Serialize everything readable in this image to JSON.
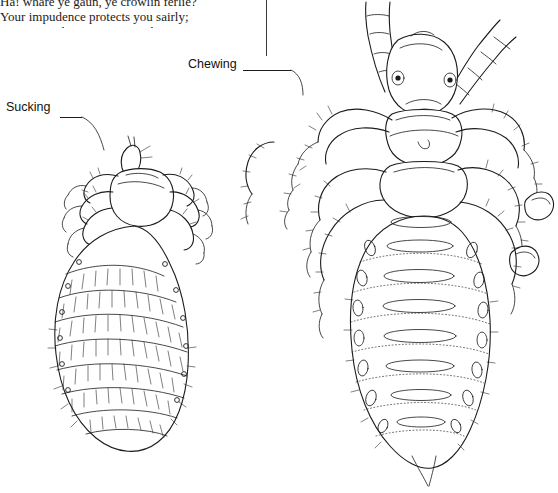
{
  "page": {
    "background_color": "#ffffff",
    "ink_color": "#1b1b1b",
    "width": 558,
    "height": 493
  },
  "poem": {
    "text": "Ha! whare ye gaun, ye crowlin ferlie?\nYour impudence protects you sairly;\nI canna say but ye strunt rarely,\n  Owre gauze and lace;\nThough faith! I fear ye dine but sparely\n  On sic a place.\n\nYe ugly, creepin, blastit wonner,\nDetested, shunn'd by saunt an' sinner!\nHow daur ye set your fit upon her,\nSae fine a lady?"
  },
  "labels": {
    "sucking": "Sucking",
    "chewing": "Chewing"
  },
  "figures": [
    {
      "name": "sucking-louse",
      "caption_ref": "Sucking",
      "description": "Dorsal view line drawing of a sucking louse with elongated abdomen, three pairs of clawed legs and short antennae"
    },
    {
      "name": "chewing-louse",
      "caption_ref": "Chewing",
      "description": "Dorsal view line drawing of a chewing louse with broad head, large mandibles, long segmented antennae and banded abdomen"
    }
  ]
}
